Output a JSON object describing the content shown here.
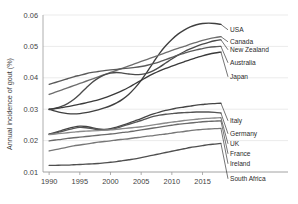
{
  "chart_data": {
    "type": "line",
    "title": "",
    "xlabel": "",
    "ylabel": "Annual incidence of gout  (%)",
    "x": [
      1990,
      1991,
      1992,
      1993,
      1994,
      1995,
      1996,
      1997,
      1998,
      1999,
      2000,
      2001,
      2002,
      2003,
      2004,
      2005,
      2006,
      2007,
      2008,
      2009,
      2010,
      2011,
      2012,
      2013,
      2014,
      2015,
      2016,
      2017,
      2018
    ],
    "xlim": [
      1989,
      2018.5
    ],
    "ylim": [
      0.01,
      0.06
    ],
    "xticks": [
      1990,
      1995,
      2000,
      2005,
      2010,
      2015
    ],
    "yticks": [
      0.01,
      0.02,
      0.03,
      0.04,
      0.05,
      0.06
    ],
    "ytick_labels": [
      "0.01",
      "0.02",
      "0.03",
      "0.04",
      "0.05",
      "0.06"
    ],
    "xtick_labels": [
      "1990",
      "1995",
      "2000",
      "2005",
      "2010",
      "2015"
    ],
    "grid": "horizontal",
    "legend_position": "right-inline-labels",
    "series": [
      {
        "name": "USA",
        "color": "#3f3f3f",
        "values": [
          0.03,
          0.0294,
          0.0289,
          0.0286,
          0.0285,
          0.0286,
          0.0289,
          0.0293,
          0.0298,
          0.0304,
          0.0311,
          0.032,
          0.0332,
          0.0348,
          0.0368,
          0.0392,
          0.042,
          0.0449,
          0.0478,
          0.0502,
          0.0522,
          0.0539,
          0.0552,
          0.0562,
          0.0569,
          0.0573,
          0.0574,
          0.0573,
          0.057
        ]
      },
      {
        "name": "Canada",
        "color": "#6e6e6e",
        "values": [
          0.0347,
          0.0354,
          0.0361,
          0.0368,
          0.0375,
          0.0382,
          0.0389,
          0.0396,
          0.0403,
          0.041,
          0.0417,
          0.0424,
          0.0431,
          0.0438,
          0.0445,
          0.0452,
          0.0459,
          0.0466,
          0.0473,
          0.048,
          0.0487,
          0.0494,
          0.05,
          0.0507,
          0.0513,
          0.0519,
          0.0524,
          0.0528,
          0.0531
        ]
      },
      {
        "name": "New Zealand",
        "color": "#4a4a4a",
        "values": [
          0.0299,
          0.0303,
          0.0309,
          0.0318,
          0.0331,
          0.0348,
          0.0367,
          0.0385,
          0.0399,
          0.0409,
          0.0415,
          0.0417,
          0.0415,
          0.0412,
          0.041,
          0.0411,
          0.0415,
          0.0423,
          0.0434,
          0.0447,
          0.046,
          0.0472,
          0.0483,
          0.0492,
          0.05,
          0.0507,
          0.0513,
          0.0518,
          0.0521
        ]
      },
      {
        "name": "Australia",
        "color": "#5a5a5a",
        "values": [
          0.0379,
          0.0385,
          0.0391,
          0.0397,
          0.0403,
          0.0408,
          0.0413,
          0.0417,
          0.042,
          0.0423,
          0.0425,
          0.0427,
          0.0429,
          0.0431,
          0.0433,
          0.0436,
          0.044,
          0.0445,
          0.0451,
          0.0458,
          0.0465,
          0.0472,
          0.0478,
          0.0484,
          0.0489,
          0.0493,
          0.0497,
          0.0499,
          0.05
        ]
      },
      {
        "name": "Japan",
        "color": "#3a3a3a",
        "values": [
          0.03,
          0.0302,
          0.0305,
          0.0308,
          0.0312,
          0.0316,
          0.032,
          0.0325,
          0.033,
          0.0336,
          0.0343,
          0.0351,
          0.036,
          0.037,
          0.0381,
          0.0392,
          0.0403,
          0.0413,
          0.0422,
          0.043,
          0.0437,
          0.0444,
          0.0451,
          0.0458,
          0.0464,
          0.047,
          0.0475,
          0.0479,
          0.0482
        ]
      },
      {
        "name": "Italy",
        "color": "#454545",
        "values": [
          0.0221,
          0.0226,
          0.0232,
          0.0238,
          0.0243,
          0.0246,
          0.0245,
          0.0241,
          0.0237,
          0.0236,
          0.0238,
          0.0243,
          0.0249,
          0.0256,
          0.0263,
          0.027,
          0.0278,
          0.0285,
          0.0291,
          0.0296,
          0.03,
          0.0304,
          0.0307,
          0.031,
          0.0313,
          0.0315,
          0.0317,
          0.0318,
          0.0319
        ]
      },
      {
        "name": "Germany",
        "color": "#555555",
        "values": [
          0.022,
          0.0224,
          0.0229,
          0.0234,
          0.0239,
          0.0242,
          0.0241,
          0.0238,
          0.0235,
          0.0234,
          0.0236,
          0.024,
          0.0246,
          0.0252,
          0.0258,
          0.0264,
          0.0271,
          0.0277,
          0.0281,
          0.0284,
          0.0286,
          0.0288,
          0.0289,
          0.029,
          0.0291,
          0.0291,
          0.0291,
          0.029,
          0.0288
        ]
      },
      {
        "name": "UK",
        "color": "#8a8a8a",
        "values": [
          0.0219,
          0.0221,
          0.0223,
          0.0225,
          0.0227,
          0.0229,
          0.023,
          0.0231,
          0.0232,
          0.0233,
          0.0234,
          0.0236,
          0.0238,
          0.024,
          0.0242,
          0.0244,
          0.0247,
          0.025,
          0.0253,
          0.0256,
          0.0259,
          0.0261,
          0.0264,
          0.0266,
          0.0268,
          0.027,
          0.0271,
          0.0272,
          0.0273
        ]
      },
      {
        "name": "France",
        "color": "#6a6a6a",
        "values": [
          0.0199,
          0.0202,
          0.0204,
          0.0207,
          0.0209,
          0.0211,
          0.0213,
          0.0215,
          0.0217,
          0.0219,
          0.0221,
          0.0223,
          0.0226,
          0.0228,
          0.0231,
          0.0234,
          0.0237,
          0.024,
          0.0243,
          0.0246,
          0.0249,
          0.0252,
          0.0254,
          0.0256,
          0.0258,
          0.026,
          0.0261,
          0.0262,
          0.0263
        ]
      },
      {
        "name": "Ireland",
        "color": "#777777",
        "values": [
          0.0167,
          0.0171,
          0.0175,
          0.0179,
          0.0183,
          0.0186,
          0.0189,
          0.0192,
          0.0195,
          0.0197,
          0.0199,
          0.0202,
          0.0204,
          0.0206,
          0.0209,
          0.0211,
          0.0214,
          0.0216,
          0.0219,
          0.0221,
          0.0224,
          0.0227,
          0.0229,
          0.0232,
          0.0234,
          0.0236,
          0.0237,
          0.0238,
          0.0239
        ]
      },
      {
        "name": "South Africa",
        "color": "#4f4f4f",
        "values": [
          0.0121,
          0.0121,
          0.0122,
          0.0122,
          0.0123,
          0.0124,
          0.0125,
          0.0126,
          0.0127,
          0.0129,
          0.0131,
          0.0133,
          0.0136,
          0.0139,
          0.0142,
          0.0146,
          0.015,
          0.0154,
          0.0158,
          0.0162,
          0.0166,
          0.017,
          0.0174,
          0.0178,
          0.0181,
          0.0184,
          0.0187,
          0.0189,
          0.0191
        ]
      }
    ]
  }
}
